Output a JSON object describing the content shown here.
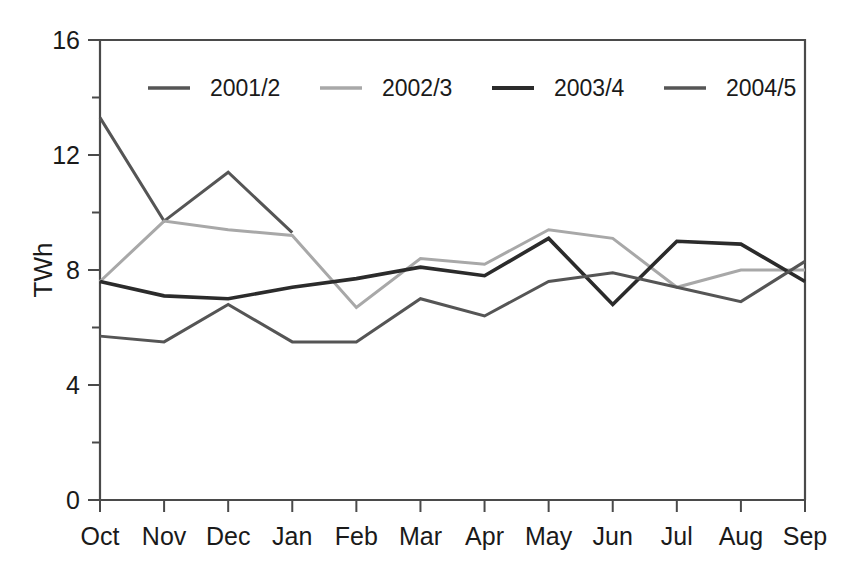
{
  "chart_data": {
    "type": "line",
    "title": "",
    "xlabel": "",
    "ylabel": "TWh",
    "categories": [
      "Oct",
      "Nov",
      "Dec",
      "Jan",
      "Feb",
      "Mar",
      "Apr",
      "May",
      "Jun",
      "Jul",
      "Aug",
      "Sep"
    ],
    "ylim": [
      0,
      16
    ],
    "yticks": [
      0,
      4,
      8,
      12,
      16
    ],
    "yticks_minor": [
      2,
      6,
      10,
      14
    ],
    "grid": false,
    "legend_position": "top-inside",
    "series": [
      {
        "name": "2001/2",
        "color": "#555555",
        "width": 3.0,
        "values": [
          13.3,
          9.7,
          11.4,
          9.3,
          null,
          null,
          null,
          null,
          null,
          null,
          null,
          null
        ]
      },
      {
        "name": "2002/3",
        "color": "#a8a8a8",
        "width": 3.0,
        "values": [
          7.6,
          9.7,
          9.4,
          9.2,
          6.7,
          8.4,
          8.2,
          9.4,
          9.1,
          7.4,
          8.0,
          8.0
        ]
      },
      {
        "name": "2003/4",
        "color": "#2b2b2b",
        "width": 3.6,
        "values": [
          7.6,
          7.1,
          7.0,
          7.4,
          7.7,
          8.1,
          7.8,
          9.1,
          6.8,
          9.0,
          8.9,
          7.6
        ]
      },
      {
        "name": "2004/5",
        "color": "#555555",
        "width": 3.0,
        "values": [
          5.7,
          5.5,
          6.8,
          5.5,
          5.5,
          7.0,
          6.4,
          7.6,
          7.9,
          7.4,
          6.9,
          8.3
        ]
      }
    ]
  },
  "legend": {
    "entries": [
      {
        "label": "2001/2"
      },
      {
        "label": "2002/3"
      },
      {
        "label": "2003/4"
      },
      {
        "label": "2004/5"
      }
    ]
  },
  "axes": {
    "y_tick_labels": [
      "0",
      "4",
      "8",
      "12",
      "16"
    ],
    "x_tick_labels": [
      "Oct",
      "Nov",
      "Dec",
      "Jan",
      "Feb",
      "Mar",
      "Apr",
      "May",
      "Jun",
      "Jul",
      "Aug",
      "Sep"
    ],
    "y_axis_title": "TWh"
  }
}
